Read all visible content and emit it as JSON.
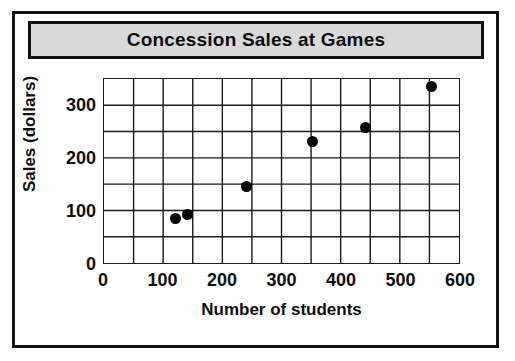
{
  "chart_data": {
    "type": "scatter",
    "title": "Concession Sales at Games",
    "xlabel": "Number of students",
    "ylabel": "Sales (dollars)",
    "xlim": [
      0,
      600
    ],
    "ylim": [
      0,
      350
    ],
    "x_ticks": [
      0,
      100,
      200,
      300,
      400,
      500,
      600
    ],
    "x_tick_labels": [
      "0",
      "100",
      "200",
      "300",
      "400",
      "500",
      "600"
    ],
    "y_ticks": [
      0,
      100,
      200,
      300
    ],
    "y_tick_labels": [
      "0",
      "100",
      "200",
      "300"
    ],
    "x_minor_step": 50,
    "y_minor_step": 50,
    "grid": true,
    "legend": false,
    "marker": "filled-circle",
    "marker_color": "#000000",
    "points": [
      {
        "x": 120,
        "y": 87
      },
      {
        "x": 140,
        "y": 95
      },
      {
        "x": 240,
        "y": 147
      },
      {
        "x": 350,
        "y": 232
      },
      {
        "x": 440,
        "y": 258
      },
      {
        "x": 550,
        "y": 335
      }
    ]
  },
  "figure": {
    "banner_color": "#d9d9d9",
    "frame_color": "#121212",
    "background": "#ffffff"
  }
}
